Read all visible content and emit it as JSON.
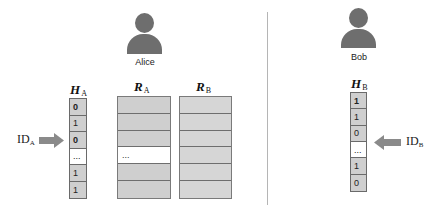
{
  "alice": {
    "label": "Alice",
    "h_title": "H",
    "h_sub": "A",
    "h_cells": [
      {
        "text": "0",
        "bold": true,
        "highlight": false
      },
      {
        "text": "1",
        "bold": false,
        "highlight": false
      },
      {
        "text": "0",
        "bold": true,
        "highlight": false
      },
      {
        "text": "...",
        "bold": false,
        "highlight": true
      },
      {
        "text": "1",
        "bold": false,
        "highlight": false
      },
      {
        "text": "1",
        "bold": false,
        "highlight": false
      }
    ],
    "id_label": "ID",
    "id_sub": "A",
    "ra_title": "R",
    "ra_sub": "A",
    "ra_cells": [
      "",
      "",
      "",
      "...",
      "",
      ""
    ],
    "rb_title": "R",
    "rb_sub": "B",
    "rb_cells": [
      "",
      "",
      "",
      "",
      "",
      ""
    ]
  },
  "bob": {
    "label": "Bob",
    "h_title": "H",
    "h_sub": "B",
    "h_cells": [
      {
        "text": "1",
        "bold": true,
        "highlight": false
      },
      {
        "text": "1",
        "bold": false,
        "highlight": false
      },
      {
        "text": "0",
        "bold": false,
        "highlight": false
      },
      {
        "text": "...",
        "bold": false,
        "highlight": true
      },
      {
        "text": "1",
        "bold": false,
        "highlight": false
      },
      {
        "text": "0",
        "bold": false,
        "highlight": false
      }
    ],
    "id_label": "ID",
    "id_sub": "B"
  },
  "colors": {
    "person": "#6e6e6e",
    "cell_fill_a": "#cfcfcf",
    "cell_fill_b": "#d6d6d6",
    "arrow": "#8a8a8a",
    "divider": "#b5b5b5"
  }
}
